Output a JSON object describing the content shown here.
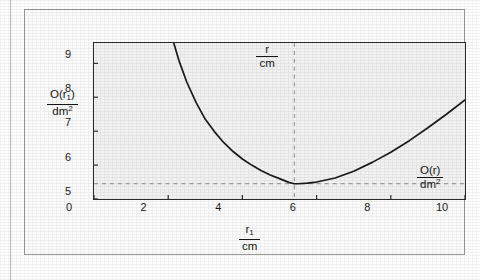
{
  "figure": {
    "caption": ""
  },
  "chart_data": {
    "type": "line",
    "title": "",
    "xlabel_num": "r",
    "xlabel_sub": "1",
    "xlabel_den": "cm",
    "ylabel_num": "O(r",
    "ylabel_num_sub": "1",
    "ylabel_num_close": ")",
    "ylabel_den": "dm",
    "ylabel_den_sup": "2",
    "xlim": [
      0,
      10
    ],
    "ylim": [
      5,
      9.6
    ],
    "xticks": [
      0,
      2,
      4,
      6,
      8,
      10
    ],
    "xtick_labels": [
      "0",
      "2",
      "4",
      "6",
      "8",
      "10"
    ],
    "yticks": [
      5,
      6,
      7,
      8,
      9
    ],
    "ytick_labels": [
      "5",
      "6",
      "7",
      "8",
      "9"
    ],
    "grid": false,
    "legend": "none",
    "series": [
      {
        "name": "O(r1)",
        "x": [
          2.15,
          2.3,
          2.5,
          2.75,
          3.0,
          3.25,
          3.5,
          3.75,
          4.0,
          4.25,
          4.5,
          4.75,
          5.0,
          5.25,
          5.4,
          5.5,
          5.75,
          6.0,
          6.5,
          7.0,
          7.5,
          8.0,
          8.5,
          9.0,
          9.5,
          10.0
        ],
        "y": [
          9.6,
          9.05,
          8.45,
          7.85,
          7.35,
          6.98,
          6.66,
          6.4,
          6.18,
          6.0,
          5.84,
          5.71,
          5.6,
          5.49,
          5.45,
          5.45,
          5.47,
          5.5,
          5.62,
          5.82,
          6.08,
          6.38,
          6.72,
          7.1,
          7.5,
          7.92
        ]
      }
    ],
    "annotations": [
      {
        "name": "minimum-vertical-guide",
        "kind": "vline",
        "x": 5.4,
        "style": "dashed",
        "label_num": "r",
        "label_den": "cm",
        "label_position": "top"
      },
      {
        "name": "minimum-horizontal-guide",
        "kind": "hline",
        "y": 5.45,
        "style": "dashed",
        "label_num": "O(r)",
        "label_den": "dm",
        "label_den_sup": "2",
        "label_position": "right"
      }
    ],
    "colors": {
      "curve": "#1a1a1a",
      "axis": "#2b2b2b",
      "guide": "#8c8c8c",
      "plot_background": "#f2f2f2",
      "page_background": "#fcfcfc"
    }
  }
}
